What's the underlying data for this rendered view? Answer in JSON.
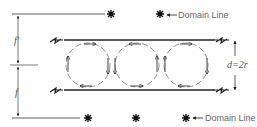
{
  "diagram": {
    "labels": {
      "upper_half": "f′",
      "lower_half": "f",
      "gap": "d=2r",
      "domain_line_top": "Domain Line",
      "domain_line_bottom": "Domain Line"
    },
    "cells": [
      {
        "cx": 88,
        "rotation": "clockwise"
      },
      {
        "cx": 137,
        "rotation": "counterclockwise"
      },
      {
        "cx": 186,
        "rotation": "clockwise"
      }
    ],
    "markers": {
      "top": [
        111,
        160
      ],
      "bottom": [
        88,
        136,
        186
      ]
    },
    "colors": {
      "line": "#222222",
      "cell": "#777777",
      "text": "#666666"
    }
  }
}
